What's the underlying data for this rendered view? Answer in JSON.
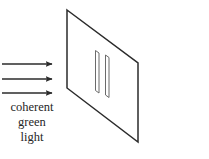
{
  "figure": {
    "type": "physics-optics-diagram"
  },
  "caption": {
    "lines": [
      "coherent",
      "green",
      "light"
    ]
  },
  "beam": {
    "icon": "right-arrow-icon",
    "count": 3,
    "arrows": [
      {
        "label": "beam-arrow-1",
        "x1": 2,
        "y1": 64,
        "x2": 57,
        "y2": 64
      },
      {
        "label": "beam-arrow-2",
        "x1": 2,
        "y1": 79,
        "x2": 57,
        "y2": 79
      },
      {
        "label": "beam-arrow-3",
        "x1": 2,
        "y1": 93,
        "x2": 57,
        "y2": 93
      }
    ]
  },
  "barrier": {
    "label": "double-slit-barrier",
    "shape": "parallelogram",
    "points": "67,10 138,63 138,142 67,88"
  },
  "slits": [
    {
      "label": "slit-left",
      "points": "95.5,50.5 99,53 99,93 95.5,90.5"
    },
    {
      "label": "slit-right",
      "points": "105.5,55 109,57.5 109,97.5 105.5,95"
    }
  ],
  "colors": {
    "stroke": "#2b2b2b",
    "slit_stroke": "#6b6b6b",
    "text": "#262626",
    "background": "#ffffff"
  }
}
